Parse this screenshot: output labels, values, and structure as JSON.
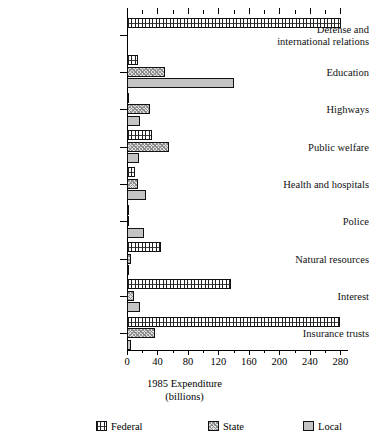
{
  "chart_data": {
    "type": "bar",
    "orientation": "horizontal",
    "title": "",
    "xlabel": "1985 Expenditure",
    "xlabel_sub": "(billions)",
    "ylabel": "",
    "xlim": [
      0,
      290
    ],
    "grid": false,
    "legend_position": "bottom",
    "categories": [
      "Defense and international relations",
      "Education",
      "Highways",
      "Public welfare",
      "Health and hospitals",
      "Police",
      "Natural resources",
      "Interest",
      "Insurance trusts"
    ],
    "series": [
      {
        "name": "Federal",
        "values": [
          281,
          14,
          1,
          33,
          10,
          1,
          45,
          136,
          280
        ]
      },
      {
        "name": "State",
        "values": [
          0,
          50,
          30,
          55,
          14,
          1,
          5,
          9,
          37
        ]
      },
      {
        "name": "Local",
        "values": [
          0,
          140,
          17,
          16,
          25,
          22,
          1,
          17,
          5
        ]
      }
    ],
    "xticks_major": [
      0,
      40,
      80,
      120,
      160,
      200,
      240,
      280
    ],
    "xticks_minor": [
      20,
      60,
      100,
      140,
      180,
      220,
      260
    ],
    "xtick_labels": [
      "0",
      "40",
      "80",
      "120",
      "160",
      "200",
      "240",
      "280"
    ]
  },
  "category_labels": [
    {
      "line1": "Defense and",
      "line2": "international relations"
    },
    {
      "line1": "Education",
      "line2": ""
    },
    {
      "line1": "Highways",
      "line2": ""
    },
    {
      "line1": "Public welfare",
      "line2": ""
    },
    {
      "line1": "Health and hospitals",
      "line2": ""
    },
    {
      "line1": "Police",
      "line2": ""
    },
    {
      "line1": "Natural resources",
      "line2": ""
    },
    {
      "line1": "Interest",
      "line2": ""
    },
    {
      "line1": "Insurance trusts",
      "line2": ""
    }
  ],
  "legend": {
    "items": [
      {
        "label": "Federal",
        "pattern": "zigzag-hatch",
        "color": "#ffffff"
      },
      {
        "label": "State",
        "pattern": "stipple",
        "color": "#e2e2e2"
      },
      {
        "label": "Local",
        "pattern": "solid",
        "color": "#c4c4c4"
      }
    ]
  },
  "axis_title": {
    "line1": "1985 Expenditure",
    "line2": "(billions)"
  }
}
